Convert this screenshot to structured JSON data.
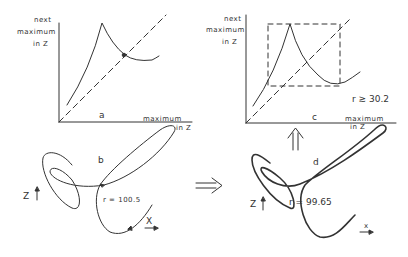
{
  "panels": {
    "a": {
      "letter": "a",
      "y_label": [
        "next",
        "maximum",
        "in Z"
      ],
      "x_label": [
        "maximum",
        "in Z"
      ]
    },
    "b": {
      "letter": "b",
      "param": "r = 100.5",
      "z_axis": "Z",
      "x_axis": "X"
    },
    "c": {
      "letter": "c",
      "y_label": [
        "next",
        "maximum",
        "in Z"
      ],
      "x_label": [
        "maximum",
        "in Z"
      ],
      "param": "r ≳ 30.2"
    },
    "d": {
      "letter": "d",
      "param": "r = 99.65",
      "z_axis": "Z",
      "x_axis": "x"
    }
  },
  "arrows": {
    "right": "⇒",
    "up": "⇑"
  },
  "colors": {
    "ink": "#333333",
    "background": "#ffffff"
  }
}
